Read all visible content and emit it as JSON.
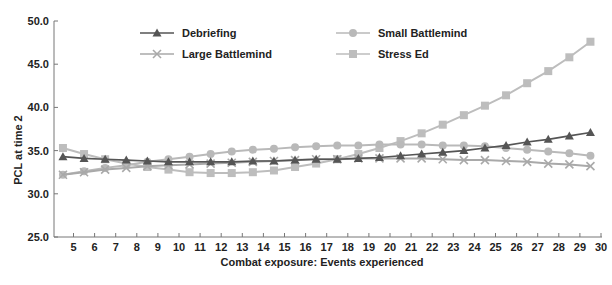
{
  "chart_data": {
    "type": "line",
    "title": "",
    "xlabel": "Combat exposure: Events experienced",
    "ylabel": "PCL at time 2",
    "ylim": [
      25.0,
      50.0
    ],
    "xlim": [
      4,
      30
    ],
    "yticks": [
      "25.0",
      "30.0",
      "35.0",
      "40.0",
      "45.0",
      "50.0"
    ],
    "xticks": [
      5,
      6,
      7,
      8,
      9,
      10,
      11,
      12,
      13,
      14,
      15,
      16,
      17,
      18,
      19,
      20,
      21,
      22,
      23,
      24,
      25,
      26,
      27,
      28,
      29,
      30
    ],
    "grid": false,
    "legend_position": "top, two columns inside plot",
    "x": [
      4.5,
      5.5,
      6.5,
      7.5,
      8.5,
      9.5,
      10.5,
      11.5,
      12.5,
      13.5,
      14.5,
      15.5,
      16.5,
      17.5,
      18.5,
      19.5,
      20.5,
      21.5,
      22.5,
      23.5,
      24.5,
      25.5,
      26.5,
      27.5,
      28.5,
      29.5
    ],
    "series": [
      {
        "name": "Debriefing",
        "marker": "triangle",
        "color": "#555555",
        "values": [
          34.3,
          34.1,
          34.0,
          33.9,
          33.8,
          33.7,
          33.7,
          33.7,
          33.7,
          33.8,
          33.8,
          33.9,
          34.0,
          34.0,
          34.1,
          34.2,
          34.4,
          34.6,
          34.8,
          35.0,
          35.3,
          35.6,
          36.0,
          36.3,
          36.7,
          37.1
        ]
      },
      {
        "name": "Small Battlemind",
        "marker": "circle",
        "color": "#b9b9b9",
        "values": [
          32.2,
          32.6,
          33.0,
          33.3,
          33.7,
          34.0,
          34.3,
          34.6,
          34.9,
          35.1,
          35.2,
          35.4,
          35.5,
          35.6,
          35.6,
          35.7,
          35.7,
          35.7,
          35.6,
          35.6,
          35.5,
          35.3,
          35.1,
          34.9,
          34.7,
          34.4
        ]
      },
      {
        "name": "Large Battlemind",
        "marker": "x",
        "color": "#a9a9a9",
        "values": [
          32.2,
          32.5,
          32.8,
          33.0,
          33.2,
          33.3,
          33.4,
          33.5,
          33.6,
          33.7,
          33.8,
          33.9,
          34.0,
          34.0,
          34.1,
          34.1,
          34.1,
          34.1,
          34.0,
          33.9,
          33.9,
          33.8,
          33.7,
          33.5,
          33.4,
          33.2
        ]
      },
      {
        "name": "Stress Ed",
        "marker": "square",
        "color": "#bdbdbd",
        "values": [
          35.3,
          34.6,
          34.0,
          33.5,
          33.1,
          32.8,
          32.5,
          32.4,
          32.4,
          32.5,
          32.7,
          33.1,
          33.5,
          34.0,
          34.6,
          35.3,
          36.1,
          37.0,
          38.0,
          39.1,
          40.2,
          41.4,
          42.8,
          44.2,
          45.8,
          47.6
        ]
      }
    ]
  },
  "legend": [
    {
      "label": "Debriefing",
      "marker": "triangle"
    },
    {
      "label": "Large Battlemind",
      "marker": "x"
    },
    {
      "label": "Small Battlemind",
      "marker": "circle"
    },
    {
      "label": "Stress Ed",
      "marker": "square"
    }
  ]
}
